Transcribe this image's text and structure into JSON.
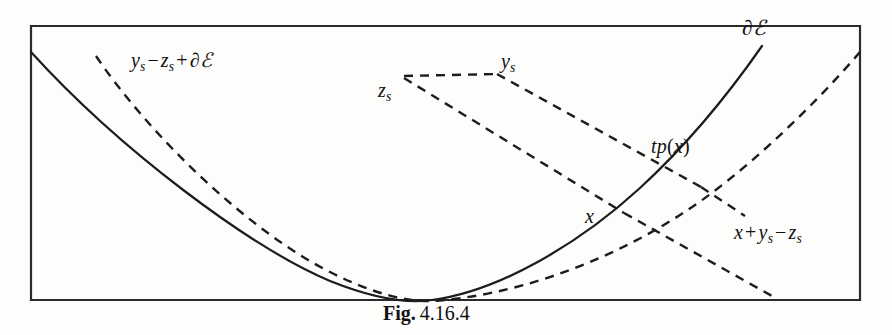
{
  "figure": {
    "caption_label": "Fig.",
    "caption_number": "4.16.4",
    "frame": {
      "left": 31,
      "top": 26,
      "right": 860,
      "bottom": 300,
      "stroke_color": "#2b2b2b"
    },
    "labels": [
      {
        "id": "boundary-e-top-right",
        "text": "∂ℰ",
        "parts": {
          "lead": "∂",
          "script": "ℰ"
        },
        "x": 742,
        "y": 18
      },
      {
        "id": "ys-minus-zs-plus-de",
        "text": "yₛ − zₛ + ∂ℰ",
        "parts": {
          "y": "y",
          "y_sub": "s",
          "minus": "−",
          "z": "z",
          "z_sub": "s",
          "plus": "+",
          "del": "∂",
          "script": "ℰ"
        },
        "x": 131,
        "y": 50
      },
      {
        "id": "ys",
        "text": "yₛ",
        "parts": {
          "base": "y",
          "sub": "s"
        },
        "x": 501,
        "y": 51
      },
      {
        "id": "zs",
        "text": "zₛ",
        "parts": {
          "base": "z",
          "sub": "s"
        },
        "x": 378,
        "y": 80
      },
      {
        "id": "tp-of-x",
        "text": "tp(x)",
        "parts": {
          "t": "t",
          "p": "p",
          "open": "(",
          "x": "x",
          "close": ")"
        },
        "x": 651,
        "y": 136
      },
      {
        "id": "x",
        "text": "x",
        "parts": {
          "base": "x"
        },
        "x": 585,
        "y": 206
      },
      {
        "id": "x-plus-ys-minus-zs",
        "text": "x + yₛ − zₛ",
        "parts": {
          "x": "x",
          "plus": "+",
          "y": "y",
          "y_sub": "s",
          "minus": "−",
          "z": "z",
          "z_sub": "s"
        },
        "x": 734,
        "y": 222
      }
    ],
    "curves": {
      "solid_parabola": {
        "name": "tp(x) solid curve",
        "path": "M 31 52 C 120 150 250 247 330 281 C 380 301 412 303 432 300 C 500 291 580 243 640 188 C 690 142 730 92 762 46",
        "style": "solid"
      },
      "dashed_parabola": {
        "name": "x + ys - zs dashed curve",
        "path": "M 96 56 C 150 136 250 232 330 272 C 375 295 410 302 432 301 C 510 296 600 266 680 215 C 740 177 810 110 860 52",
        "style": "dashed"
      }
    },
    "connectors": [
      {
        "name": "zs-to-ys-horizontal",
        "path": "M 404 76 L 497 74"
      },
      {
        "name": "ys-to-tangent-point",
        "path": "M 497 74 L 699 186"
      },
      {
        "name": "zs-to-x-diagonal",
        "path": "M 404 77 L 622 212"
      },
      {
        "name": "x-to-curve-point",
        "path": "M 622 212 L 770 295"
      },
      {
        "name": "tangent-short-cross",
        "path": "M 699 186 L 742 214"
      }
    ],
    "colors": {
      "ink": "#1c1c1c",
      "frame": "#2b2b2b",
      "background": "#fdfdfc"
    }
  }
}
